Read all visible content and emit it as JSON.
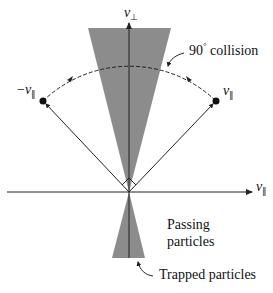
{
  "diagram": {
    "type": "velocity-space loss-cone",
    "axes": {
      "vertical": {
        "symbol": "v",
        "subscript": "⊥"
      },
      "horizontal": {
        "symbol": "v",
        "subscript": "∥"
      }
    },
    "points": {
      "left": {
        "prefix": "−",
        "symbol": "v",
        "subscript": "∥"
      },
      "right": {
        "symbol": "v",
        "subscript": "∥"
      }
    },
    "annotations": {
      "collision_angle": "90",
      "collision_degree": "°",
      "collision_text": "collision",
      "passing_line1": "Passing",
      "passing_line2": "particles",
      "trapped": "Trapped particles"
    },
    "colors": {
      "cone_fill": "#8c8c8c",
      "line": "#222222",
      "background": "#ffffff"
    }
  }
}
